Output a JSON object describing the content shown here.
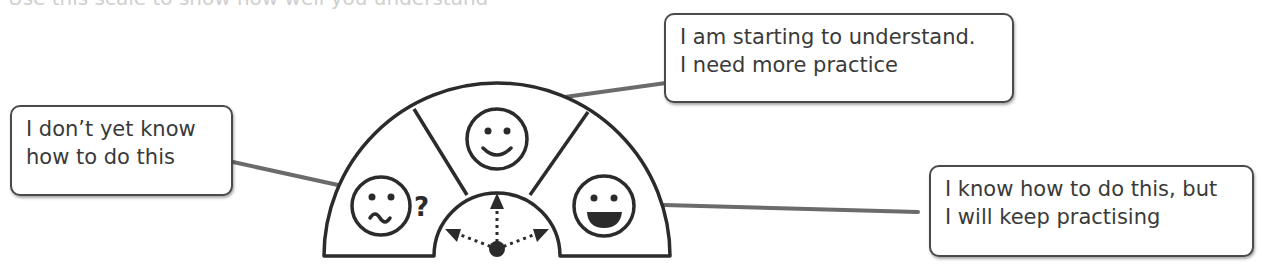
{
  "diagram": {
    "top_cut_text": "Use this scale to show how well you understand",
    "segments": [
      {
        "id": "left",
        "icon": "confused-face-with-question-mark",
        "glyph": "?"
      },
      {
        "id": "middle",
        "icon": "smiling-face"
      },
      {
        "id": "right",
        "icon": "grinning-face"
      }
    ],
    "pointer": {
      "icon": "dial-pointer-with-three-dotted-arrows"
    },
    "callouts": [
      {
        "id": "left",
        "lines": [
          "I don’t yet know",
          "how to do this"
        ]
      },
      {
        "id": "middle",
        "lines": [
          "I am starting to understand.",
          "I need more practice"
        ]
      },
      {
        "id": "right",
        "lines": [
          "I know how to do this, but",
          "I will keep practising"
        ]
      }
    ],
    "colors": {
      "stroke": "#2b2b2b",
      "connector": "#6b6b6b",
      "text": "#3a3a3a",
      "background": "#ffffff"
    }
  }
}
